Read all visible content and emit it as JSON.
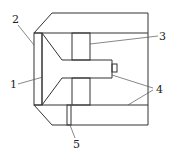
{
  "diagram": {
    "type": "mechanical cross-section",
    "labels": [
      {
        "id": "1",
        "text": "1"
      },
      {
        "id": "2",
        "text": "2"
      },
      {
        "id": "3",
        "text": "3"
      },
      {
        "id": "4",
        "text": "4"
      },
      {
        "id": "5",
        "text": "5"
      }
    ],
    "colors": {
      "line": "#333333",
      "hatch": "#444444",
      "background": "#ffffff"
    }
  }
}
